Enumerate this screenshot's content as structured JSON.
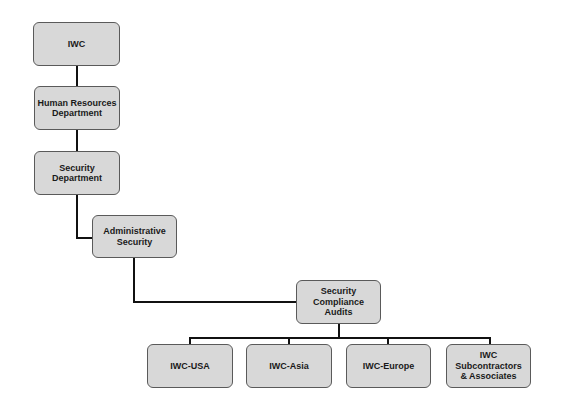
{
  "diagram": {
    "type": "org-chart",
    "nodes": [
      {
        "id": "iwc",
        "label": "IWC"
      },
      {
        "id": "hr",
        "label": "Human Resources\nDepartment"
      },
      {
        "id": "security_dept",
        "label": "Security\nDepartment"
      },
      {
        "id": "admin_security",
        "label": "Administrative\nSecurity"
      },
      {
        "id": "sca",
        "label": "Security\nCompliance\nAudits"
      },
      {
        "id": "iwc_usa",
        "label": "IWC-USA"
      },
      {
        "id": "iwc_asia",
        "label": "IWC-Asia"
      },
      {
        "id": "iwc_europe",
        "label": "IWC-Europe"
      },
      {
        "id": "iwc_subs",
        "label": "IWC\nSubcontractors\n& Associates"
      }
    ],
    "edges": [
      [
        "iwc",
        "hr"
      ],
      [
        "hr",
        "security_dept"
      ],
      [
        "security_dept",
        "admin_security"
      ],
      [
        "admin_security",
        "sca"
      ],
      [
        "sca",
        "iwc_usa"
      ],
      [
        "sca",
        "iwc_asia"
      ],
      [
        "sca",
        "iwc_europe"
      ],
      [
        "sca",
        "iwc_subs"
      ]
    ],
    "colors": {
      "node_fill": "#d8d8d8",
      "node_border": "#5a5a5a",
      "connector": "#111111"
    }
  }
}
